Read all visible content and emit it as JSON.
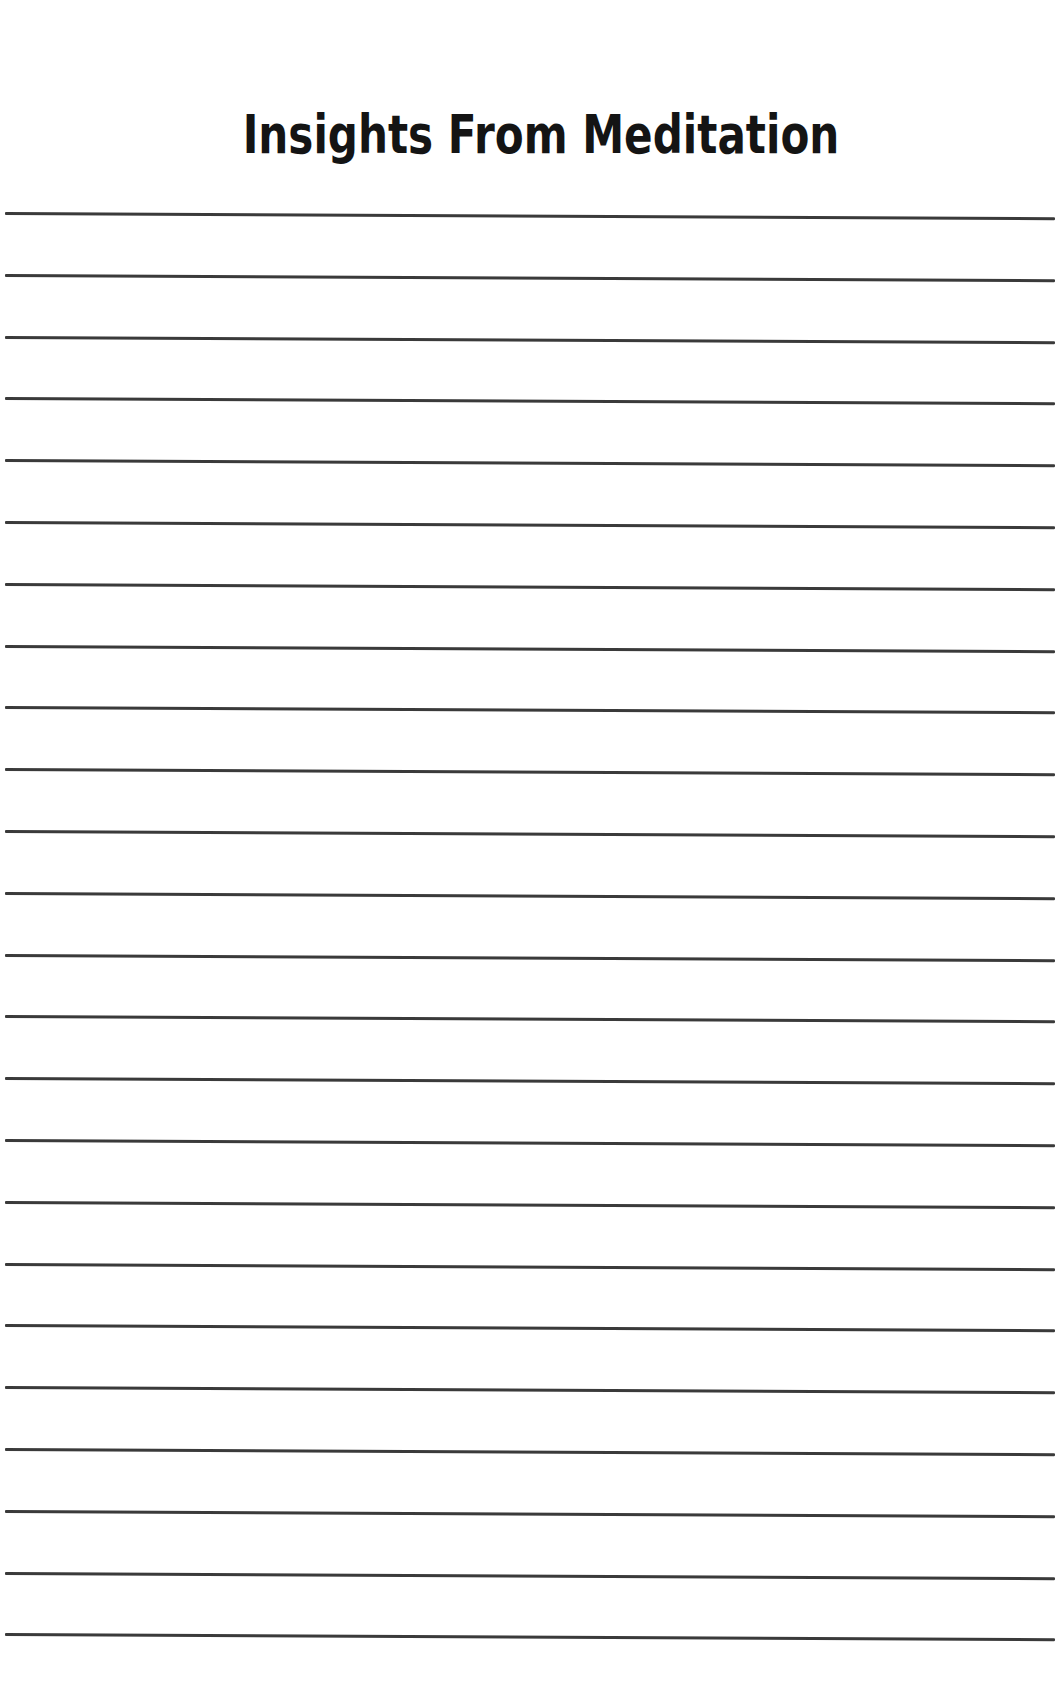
{
  "page": {
    "title": "Insights From Meditation",
    "line_color": "#3a3a3a",
    "background_color": "#ffffff",
    "ruled_lines": {
      "count": 24,
      "first_y": 213,
      "spacing": 61.8
    }
  }
}
